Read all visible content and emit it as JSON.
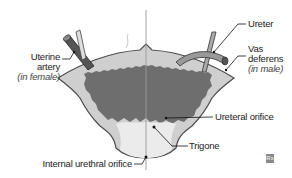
{
  "diagram": {
    "labels": {
      "uterine_artery_line1": "Uterine",
      "uterine_artery_line2": "artery",
      "uterine_artery_note": "(in female)",
      "ureter": "Ureter",
      "vas_deferens_line1": "Vas",
      "vas_deferens_line2": "deferens",
      "vas_deferens_note": "(in male)",
      "ureteral_orifice": "Ureteral orifice",
      "trigone": "Trigone",
      "internal_urethral_orifice": "Internal urethral orifice"
    },
    "badge": "Rx",
    "colors": {
      "wall_outer": "#c9c9c9",
      "wall_outline": "#444444",
      "mucosa": "#6e6e6e",
      "trigone": "#e6e6e6",
      "midline": "#9a9a9a",
      "leader": "#111111"
    }
  }
}
